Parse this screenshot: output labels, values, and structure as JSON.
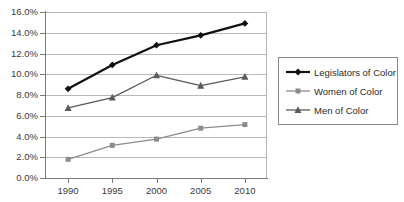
{
  "chart_data": {
    "type": "line",
    "title": "",
    "xlabel": "",
    "ylabel": "",
    "categories": [
      "1990",
      "1995",
      "2000",
      "2005",
      "2010"
    ],
    "x": [
      1990,
      1995,
      2000,
      2005,
      2010
    ],
    "ylim": [
      0,
      16
    ],
    "ytick_values": [
      0,
      2,
      4,
      6,
      8,
      10,
      12,
      14,
      16
    ],
    "ytick_labels": [
      "0.0%",
      "2.0%",
      "4.0%",
      "6.0%",
      "8.0%",
      "10.0%",
      "12.0%",
      "14.0%",
      "16.0%"
    ],
    "grid": "horizontal",
    "legend_position": "right",
    "value_suffix": "%",
    "series": [
      {
        "name": "Legislators of Color",
        "values": [
          8.6,
          10.9,
          12.8,
          13.75,
          14.9
        ],
        "color": "#111111",
        "marker": "diamond",
        "line_width": 2.2
      },
      {
        "name": "Women of Color",
        "values": [
          1.8,
          3.15,
          3.75,
          4.8,
          5.15
        ],
        "color": "#8c8c8c",
        "marker": "square",
        "line_width": 1.3
      },
      {
        "name": "Men of Color",
        "values": [
          6.75,
          7.75,
          9.9,
          8.9,
          9.75
        ],
        "color": "#5a5a5a",
        "marker": "triangle",
        "line_width": 1.3
      }
    ]
  },
  "axes": {
    "y_tick_labels": [
      "16.0%",
      "14.0%",
      "12.0%",
      "10.0%",
      "8.0%",
      "6.0%",
      "4.0%",
      "2.0%",
      "0.0%"
    ],
    "x_tick_labels": [
      "1990",
      "1995",
      "2000",
      "2005",
      "2010"
    ]
  },
  "legend": {
    "items": [
      {
        "label": "Legislators of Color",
        "marker": "diamond",
        "color": "#111111"
      },
      {
        "label": "Women of Color",
        "marker": "square",
        "color": "#8c8c8c"
      },
      {
        "label": "Men of Color",
        "marker": "triangle",
        "color": "#5a5a5a"
      }
    ]
  }
}
